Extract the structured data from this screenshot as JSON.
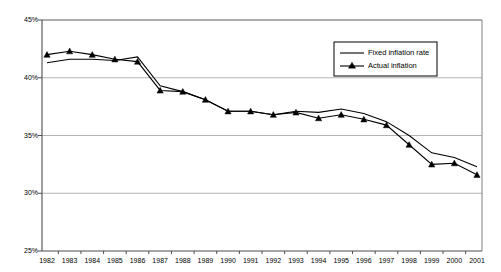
{
  "chart_data": {
    "type": "line",
    "title": "",
    "subtitle": "",
    "xlabel": "",
    "ylabel": "",
    "grid": true,
    "gridlines": "horizontal",
    "legend_position": "top-right-inside",
    "x": [
      "1982",
      "1983",
      "1984",
      "1985",
      "1986",
      "1987",
      "1988",
      "1989",
      "1990",
      "1991",
      "1992",
      "1993",
      "1994",
      "1995",
      "1996",
      "1997",
      "1998",
      "1999",
      "2000",
      "2001"
    ],
    "categories": [
      "1982",
      "1983",
      "1984",
      "1985",
      "1986",
      "1987",
      "1988",
      "1989",
      "1990",
      "1991",
      "1992",
      "1993",
      "1994",
      "1995",
      "1996",
      "1997",
      "1998",
      "1999",
      "2000",
      "2001"
    ],
    "ylim": [
      25,
      45
    ],
    "ytick_values": [
      25,
      30,
      35,
      40,
      45
    ],
    "ytick_labels": [
      "25%",
      "30%",
      "35%",
      "40%",
      "45%"
    ],
    "xtick_labels": [
      "1982",
      "1983",
      "1984",
      "1985",
      "1986",
      "1987",
      "1988",
      "1989",
      "1990",
      "1991",
      "1992",
      "1993",
      "1994",
      "1995",
      "1996",
      "1997",
      "1998",
      "1999",
      "2000",
      "2001"
    ],
    "series": [
      {
        "name": "Fixed inflation rate",
        "marker": "none",
        "color": "#000000",
        "values": [
          41.3,
          41.6,
          41.6,
          41.5,
          41.8,
          39.3,
          38.8,
          38.1,
          37.1,
          37.1,
          36.8,
          37.1,
          37.0,
          37.3,
          36.9,
          36.2,
          35.0,
          33.5,
          33.1,
          32.3
        ]
      },
      {
        "name": "Actual inflation",
        "marker": "triangle",
        "color": "#000000",
        "values": [
          42.0,
          42.3,
          42.0,
          41.6,
          41.4,
          38.9,
          38.8,
          38.1,
          37.1,
          37.1,
          36.8,
          37.0,
          36.5,
          36.8,
          36.4,
          35.9,
          34.2,
          32.5,
          32.6,
          31.6
        ]
      }
    ]
  },
  "legend": {
    "items": [
      {
        "label": "Fixed inflation rate",
        "marker": "line"
      },
      {
        "label": "Actual inflation",
        "marker": "line-triangle"
      }
    ]
  },
  "axes": {
    "y_labels": [
      "45%",
      "40%",
      "35%",
      "30%",
      "25%"
    ],
    "x_labels": [
      "1982",
      "1983",
      "1984",
      "1985",
      "1986",
      "1987",
      "1988",
      "1989",
      "1990",
      "1991",
      "1992",
      "1993",
      "1994",
      "1995",
      "1996",
      "1997",
      "1998",
      "1999",
      "2000",
      "2001"
    ]
  }
}
